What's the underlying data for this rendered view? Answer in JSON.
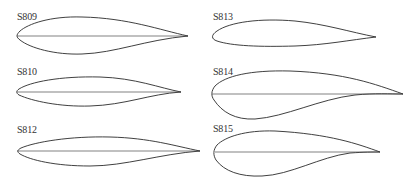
{
  "figure": {
    "airfoils": [
      {
        "id": "s809",
        "label": "S809",
        "label_pos": [
          17,
          12
        ],
        "chord_line": true
      },
      {
        "id": "s813",
        "label": "S813",
        "label_pos": [
          213,
          12
        ],
        "chord_line": false
      },
      {
        "id": "s810",
        "label": "S810",
        "label_pos": [
          17,
          67
        ],
        "chord_line": true
      },
      {
        "id": "s814",
        "label": "S814",
        "label_pos": [
          213,
          67
        ],
        "chord_line": true
      },
      {
        "id": "s812",
        "label": "S812",
        "label_pos": [
          17,
          125
        ],
        "chord_line": true
      },
      {
        "id": "s815",
        "label": "S815",
        "label_pos": [
          213,
          124
        ],
        "chord_line": true
      }
    ],
    "colors": {
      "stroke": "#2a2a2a",
      "label": "#333333",
      "background": "#ffffff"
    }
  }
}
